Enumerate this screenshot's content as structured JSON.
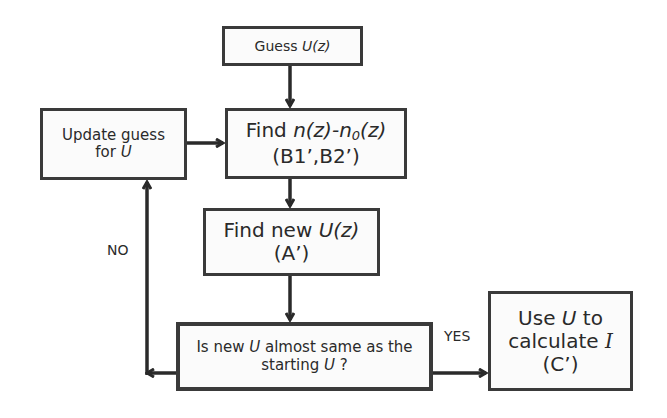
{
  "diagram": {
    "type": "flowchart",
    "nodes": {
      "guess": {
        "prefix": "Guess ",
        "var": "U(z)"
      },
      "update": {
        "line1": "Update guess",
        "line2_prefix": "for ",
        "line2_var": "U"
      },
      "find_n": {
        "line1_prefix": "Find ",
        "line1_var_a": "n(z)-n",
        "line1_sub": "0",
        "line1_var_b": "(z)",
        "line2": "(B1’,B2’)"
      },
      "find_u": {
        "line1_prefix": "Find new ",
        "line1_var": "U(z)",
        "line2": "(A’)"
      },
      "decision": {
        "line1_prefix": "Is new ",
        "line1_var": "U",
        "line1_suffix": " almost same as the",
        "line2_prefix": "starting ",
        "line2_var": "U",
        "line2_suffix": " ?"
      },
      "result": {
        "line1_prefix": "Use ",
        "line1_var": "U",
        "line1_suffix": " to",
        "line2_prefix": "calculate ",
        "line2_var": "I",
        "line3": "(C’)"
      }
    },
    "edge_labels": {
      "no": "NO",
      "yes": "YES"
    },
    "colors": {
      "stroke": "#3a3a3a",
      "fill": "#fbfbfb",
      "text": "#2a2a2a"
    }
  }
}
